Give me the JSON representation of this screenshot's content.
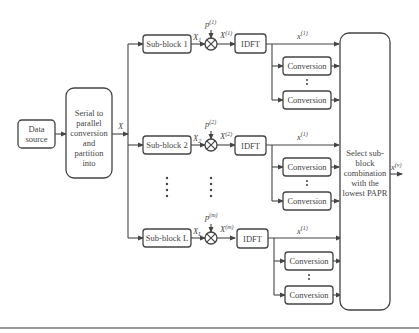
{
  "diagram": {
    "type": "block-diagram",
    "nodes": {
      "data_source": {
        "line1": "Data",
        "line2": "source"
      },
      "sp": {
        "lines": [
          "Serial to",
          "parallel",
          "conversion",
          "and",
          "partition",
          "into"
        ]
      },
      "sp_out_label": "X",
      "subblocks": [
        {
          "label": "Sub-block 1",
          "out_var": "X",
          "out_sub": "1",
          "phase_var": "p",
          "phase_sup": "(1)",
          "mult_var": "X",
          "mult_sub": "1",
          "mult_sup": "(1)",
          "idft": "IDFT",
          "time_var": "x",
          "time_sub": "1",
          "time_sup": "(1)"
        },
        {
          "label": "Sub-block 2",
          "out_var": "X",
          "out_sub": "2",
          "phase_var": "p",
          "phase_sup": "(2)",
          "mult_var": "X",
          "mult_sub": "2",
          "mult_sup": "(2)",
          "idft": "IDFT",
          "time_var": "x",
          "time_sub": "2",
          "time_sup": "(1)"
        },
        {
          "label": "Sub-block L",
          "out_var": "X",
          "out_sub": "L",
          "phase_var": "p",
          "phase_sup": "(m)",
          "mult_var": "X",
          "mult_sub": "L",
          "mult_sup": "(m)",
          "idft": "IDFT",
          "time_var": "x",
          "time_sub": "L",
          "time_sup": "(1)"
        }
      ],
      "conversion_label": "Conversion",
      "selector": {
        "lines": [
          "Select sub-",
          "block",
          "combination",
          "with the",
          "lowest PAPR"
        ]
      },
      "output": {
        "var": "x",
        "sup": "(v)"
      }
    }
  }
}
